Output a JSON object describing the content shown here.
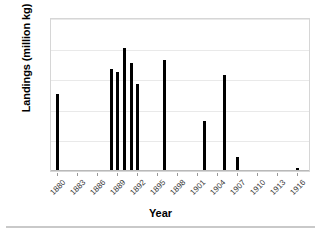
{
  "chart_data": {
    "type": "bar",
    "title": "",
    "xlabel": "Year",
    "ylabel": "Landings (million kg)",
    "ylim": [
      0,
      2.5
    ],
    "yticks": [
      "0",
      "0.5",
      "1",
      "1.5",
      "2",
      "2.5"
    ],
    "ytick_values": [
      0,
      0.5,
      1,
      1.5,
      2,
      2.5
    ],
    "xlim": [
      1879,
      1918
    ],
    "xticks": [
      "1880",
      "1883",
      "1886",
      "1889",
      "1892",
      "1895",
      "1898",
      "1901",
      "1904",
      "1907",
      "1910",
      "1913",
      "1916"
    ],
    "xtick_values": [
      1880,
      1883,
      1886,
      1889,
      1892,
      1895,
      1898,
      1901,
      1904,
      1907,
      1910,
      1913,
      1916
    ],
    "grid": true,
    "legend": false,
    "bar_color": "#000000",
    "x": [
      1880,
      1888,
      1889,
      1890,
      1891,
      1892,
      1893,
      1896,
      1902,
      1905,
      1907,
      1916
    ],
    "values": [
      1.25,
      1.65,
      1.6,
      2.0,
      1.75,
      1.4,
      0,
      1.8,
      0.8,
      1.55,
      0.21,
      0.04
    ],
    "series": [
      {
        "name": "Landings",
        "points": [
          {
            "year": 1880,
            "value": 1.25
          },
          {
            "year": 1888,
            "value": 1.65
          },
          {
            "year": 1889,
            "value": 1.6
          },
          {
            "year": 1890,
            "value": 2.0
          },
          {
            "year": 1891,
            "value": 1.75
          },
          {
            "year": 1892,
            "value": 1.4
          },
          {
            "year": 1896,
            "value": 1.8
          },
          {
            "year": 1902,
            "value": 0.8
          },
          {
            "year": 1905,
            "value": 1.55
          },
          {
            "year": 1907,
            "value": 0.21
          },
          {
            "year": 1916,
            "value": 0.04
          }
        ]
      }
    ]
  }
}
